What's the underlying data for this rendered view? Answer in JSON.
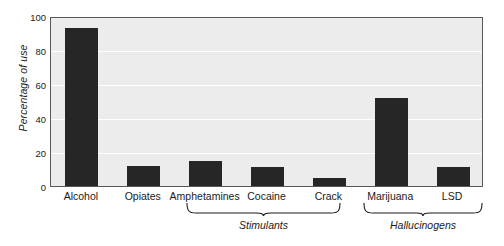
{
  "chart_data": {
    "type": "bar",
    "title": "",
    "xlabel": "",
    "ylabel": "Percentage of use",
    "ylim": [
      0,
      100
    ],
    "yticks": [
      0,
      20,
      40,
      60,
      80,
      100
    ],
    "grid": true,
    "legend": "none",
    "bar_color": "#262626",
    "plot_background": "#ececec",
    "categories": [
      "Alcohol",
      "Opiates",
      "Amphetamines",
      "Cocaine",
      "Crack",
      "Marijuana",
      "LSD"
    ],
    "values": [
      93,
      12,
      15,
      11,
      5,
      52,
      11
    ],
    "groups": [
      {
        "label": "Stimulants",
        "members": [
          "Amphetamines",
          "Cocaine",
          "Crack"
        ]
      },
      {
        "label": "Hallucinogens",
        "members": [
          "Marijuana",
          "LSD"
        ]
      }
    ]
  },
  "axis": {
    "y_title": "Percentage of use",
    "y_tick_labels": [
      "100",
      "80",
      "60",
      "40",
      "20",
      "0"
    ]
  },
  "bars": [
    {
      "name": "alcohol",
      "label": "Alcohol",
      "value": 93
    },
    {
      "name": "opiates",
      "label": "Opiates",
      "value": 12
    },
    {
      "name": "amphetamines",
      "label": "Amphetamines",
      "value": 15
    },
    {
      "name": "cocaine",
      "label": "Cocaine",
      "value": 11
    },
    {
      "name": "crack",
      "label": "Crack",
      "value": 5
    },
    {
      "name": "marijuana",
      "label": "Marijuana",
      "value": 52
    },
    {
      "name": "lsd",
      "label": "LSD",
      "value": 11
    }
  ],
  "groups": [
    {
      "name": "stimulants",
      "label": "Stimulants"
    },
    {
      "name": "hallucinogens",
      "label": "Hallucinogens"
    }
  ]
}
